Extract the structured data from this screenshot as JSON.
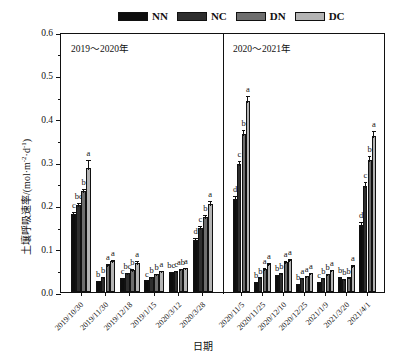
{
  "chart_data": {
    "type": "bar",
    "title": "",
    "xlabel": "日期",
    "ylabel_parts": {
      "main": "土壤呼吸速率/(mol·m",
      "sup1": "-2",
      "mid": "·d",
      "sup2": "-1",
      "tail": ")"
    },
    "ylabel": "土壤呼吸速率/(mol·m-2·d-1)",
    "ylim": [
      0,
      0.6
    ],
    "yticks": [
      0.0,
      0.1,
      0.2,
      0.3,
      0.4,
      0.5,
      0.6
    ],
    "ytick_labels": [
      "0.0",
      "0.1",
      "0.2",
      "0.3",
      "0.4",
      "0.5",
      "0.6"
    ],
    "yminor_step": 0.05,
    "grid": false,
    "legend_position": "top",
    "panels": [
      {
        "label": "2019～2020年",
        "categories_index": [
          0,
          1,
          2,
          3,
          4,
          5
        ]
      },
      {
        "label": "2020～2021年",
        "categories_index": [
          6,
          7,
          8,
          9,
          10,
          11,
          12
        ]
      }
    ],
    "categories": [
      "2019/10/30",
      "2019/11/30",
      "2019/12/18",
      "2019/1/15",
      "2020/3/12",
      "2020/3/28",
      "2020/11/5",
      "2020/11/25",
      "2020/12/10",
      "2020/12/25",
      "2021/1/9",
      "2021/3/20",
      "2021/4/1"
    ],
    "series": [
      {
        "name": "NN",
        "color": "#0d0d0d",
        "values": [
          0.18,
          0.026,
          0.033,
          0.027,
          0.046,
          0.12,
          0.215,
          0.023,
          0.039,
          0.019,
          0.023,
          0.035,
          0.155
        ],
        "errors": [
          0.009,
          0.004,
          0.004,
          0.004,
          0.005,
          0.01,
          0.012,
          0.004,
          0.004,
          0.004,
          0.004,
          0.004,
          0.011
        ],
        "letters": [
          "c",
          "b",
          "c",
          "c",
          "bc",
          "d",
          "d",
          "b",
          "b",
          "b",
          "c",
          "b",
          "d"
        ]
      },
      {
        "name": "NC",
        "color": "#2e2e2e",
        "values": [
          0.2,
          0.035,
          0.043,
          0.035,
          0.049,
          0.147,
          0.295,
          0.034,
          0.043,
          0.032,
          0.033,
          0.031,
          0.245
        ],
        "errors": [
          0.009,
          0.005,
          0.005,
          0.004,
          0.005,
          0.01,
          0.013,
          0.004,
          0.005,
          0.004,
          0.004,
          0.004,
          0.013
        ],
        "letters": [
          "bc",
          "b",
          "bc",
          "b",
          "c",
          "c",
          "c",
          "b",
          "b",
          "a",
          "b",
          "b",
          "c"
        ]
      },
      {
        "name": "DN",
        "color": "#6e6e6e",
        "values": [
          0.232,
          0.062,
          0.051,
          0.042,
          0.052,
          0.172,
          0.365,
          0.054,
          0.07,
          0.038,
          0.042,
          0.034,
          0.305
        ],
        "errors": [
          0.011,
          0.007,
          0.006,
          0.005,
          0.005,
          0.011,
          0.014,
          0.006,
          0.007,
          0.004,
          0.004,
          0.004,
          0.014
        ],
        "letters": [
          "b",
          "a",
          "b",
          "b",
          "ab",
          "b",
          "b",
          "a",
          "a",
          "a",
          "b",
          "b",
          "b"
        ]
      },
      {
        "name": "DC",
        "color": "#b4b4b4",
        "values": [
          0.287,
          0.072,
          0.068,
          0.049,
          0.055,
          0.203,
          0.44,
          0.064,
          0.073,
          0.043,
          0.05,
          0.06,
          0.36
        ],
        "errors": [
          0.022,
          0.007,
          0.008,
          0.005,
          0.005,
          0.012,
          0.018,
          0.007,
          0.007,
          0.005,
          0.005,
          0.006,
          0.017
        ],
        "letters": [
          "a",
          "a",
          "a",
          "a",
          "a",
          "a",
          "a",
          "a",
          "a",
          "a",
          "a",
          "a",
          "a"
        ]
      }
    ]
  },
  "legend": {
    "items": [
      {
        "label": "NN",
        "color": "#0d0d0d"
      },
      {
        "label": "NC",
        "color": "#2e2e2e"
      },
      {
        "label": "DN",
        "color": "#6e6e6e"
      },
      {
        "label": "DC",
        "color": "#b4b4b4"
      }
    ]
  }
}
